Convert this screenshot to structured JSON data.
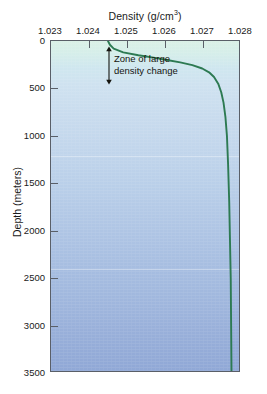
{
  "chart_data": {
    "type": "line",
    "title": "",
    "xlabel": "Density (g/cm3)",
    "xlabel_base": "Density (g/cm",
    "xlabel_sup": "3",
    "xlabel_tail": ")",
    "ylabel": "Depth (meters)",
    "xlim": [
      1.023,
      1.028
    ],
    "ylim": [
      0,
      3500
    ],
    "y_inverted": true,
    "grid": false,
    "legend": null,
    "xticks": [
      "1.023",
      "1.024",
      "1.025",
      "1.026",
      "1.027",
      "1.028"
    ],
    "xtick_values": [
      1.023,
      1.024,
      1.025,
      1.026,
      1.027,
      1.028
    ],
    "yticks": [
      "0",
      "500",
      "1000",
      "1500",
      "2000",
      "2500",
      "3000",
      "3500"
    ],
    "ytick_values": [
      0,
      500,
      1000,
      1500,
      2000,
      2500,
      3000,
      3500
    ],
    "series": [
      {
        "name": "Seawater density profile",
        "color": "#2d7a52",
        "x": [
          1.0245,
          1.02455,
          1.02465,
          1.0249,
          1.0253,
          1.0257,
          1.02605,
          1.0264,
          1.02672,
          1.02698,
          1.02716,
          1.02729,
          1.0274,
          1.02748,
          1.02754,
          1.02759,
          1.02763,
          1.02766,
          1.02769,
          1.02771,
          1.02773,
          1.02774,
          1.02775
        ],
        "y": [
          0,
          40,
          80,
          120,
          150,
          175,
          200,
          225,
          255,
          290,
          330,
          380,
          450,
          540,
          650,
          800,
          1000,
          1300,
          1700,
          2100,
          2500,
          3000,
          3500
        ]
      }
    ],
    "annotations": [
      {
        "name": "pycnocline-label",
        "text_lines": [
          "Zone of large",
          "density change"
        ],
        "arrow": "double-headed-vertical",
        "arrow_top_depth": 60,
        "arrow_bottom_depth": 470
      }
    ]
  }
}
